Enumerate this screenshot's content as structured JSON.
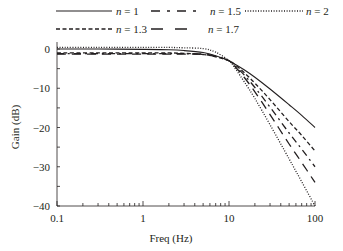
{
  "chart_data": {
    "type": "line",
    "title": "",
    "xlabel": "Freq (Hz)",
    "ylabel": "Gain (dB)",
    "xscale": "log",
    "xlim": [
      0.1,
      100
    ],
    "ylim": [
      -40,
      2
    ],
    "xticks": [
      0.1,
      1,
      10,
      100
    ],
    "xtick_labels": [
      "0.1",
      "1",
      "10",
      "100"
    ],
    "yticks": [
      0,
      -10,
      -20,
      -30,
      -40
    ],
    "ytick_labels": [
      "0",
      "−10",
      "−20",
      "−30",
      "−40"
    ],
    "grid": false,
    "legend_position": "top",
    "x": [
      0.1,
      0.3,
      1,
      2,
      3,
      5,
      7,
      10,
      12,
      15,
      20,
      30,
      50,
      70,
      100
    ],
    "series": [
      {
        "name": "n = 1",
        "style": "solid",
        "values": [
          0,
          0,
          -0.1,
          -0.2,
          -0.4,
          -0.9,
          -1.7,
          -3.0,
          -4.0,
          -5.3,
          -7.2,
          -10.2,
          -14.2,
          -16.9,
          -20.0
        ]
      },
      {
        "name": "n = 1.3",
        "style": "dashed",
        "values": [
          -1.0,
          -1.0,
          -1.0,
          -1.0,
          -1.1,
          -1.4,
          -2.0,
          -3.0,
          -4.2,
          -6.0,
          -8.7,
          -12.9,
          -18.5,
          -22.0,
          -26.0
        ]
      },
      {
        "name": "n = 1.5",
        "style": "dashdot",
        "values": [
          -1.2,
          -1.2,
          -1.2,
          -1.2,
          -1.2,
          -1.4,
          -1.9,
          -3.0,
          -4.5,
          -6.6,
          -9.8,
          -14.8,
          -21.4,
          -25.5,
          -30.0
        ]
      },
      {
        "name": "n = 1.7",
        "style": "longdash",
        "values": [
          -1.3,
          -1.3,
          -1.3,
          -1.3,
          -1.3,
          -1.3,
          -1.8,
          -3.0,
          -4.7,
          -7.2,
          -10.9,
          -16.7,
          -24.2,
          -28.9,
          -34.0
        ]
      },
      {
        "name": "n = 2",
        "style": "dotted",
        "values": [
          0.4,
          0.4,
          0.4,
          0.4,
          0.3,
          0.1,
          -0.8,
          -3.0,
          -5.2,
          -8.3,
          -12.6,
          -19.3,
          -28.0,
          -33.8,
          -40.0
        ]
      }
    ]
  },
  "legend": {
    "items": [
      {
        "label": "n = 1",
        "style": "solid"
      },
      {
        "label": "n = 1.5",
        "style": "dashdot"
      },
      {
        "label": "n = 2",
        "style": "dotted"
      },
      {
        "label": "n = 1.3",
        "style": "dashed"
      },
      {
        "label": "n = 1.7",
        "style": "longdash"
      }
    ]
  },
  "colors": {
    "ink": "#231f20",
    "background": "#ffffff"
  }
}
